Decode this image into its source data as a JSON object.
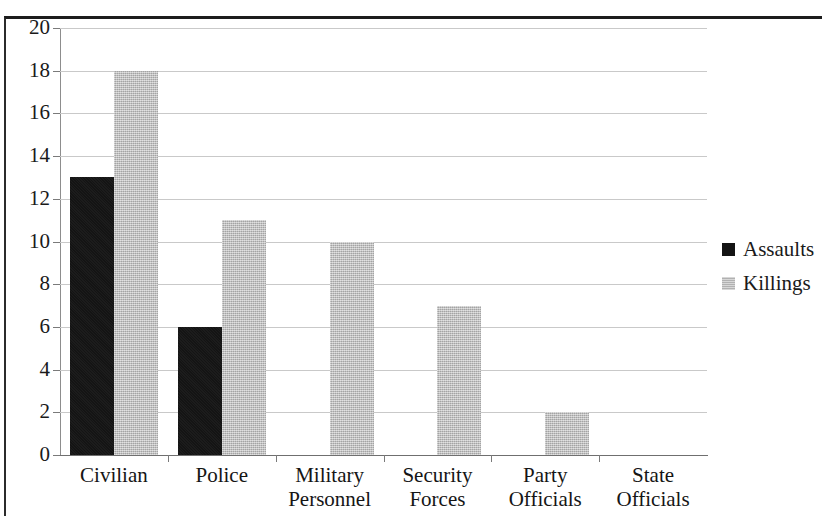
{
  "chart_data": {
    "type": "bar",
    "title": "",
    "subtitle": "",
    "xlabel": "",
    "ylabel": "",
    "categories": [
      "Civilian",
      "Police",
      "Military Personnel",
      "Security Forces",
      "Party Officials",
      "State Officials"
    ],
    "category_lines": [
      [
        "Civilian"
      ],
      [
        "Police"
      ],
      [
        "Military",
        "Personnel"
      ],
      [
        "Security",
        "Forces"
      ],
      [
        "Party",
        "Officials"
      ],
      [
        "State",
        "Officials"
      ]
    ],
    "series": [
      {
        "name": "Assaults",
        "color": "#141414",
        "values": [
          13,
          6,
          0,
          0,
          0,
          0
        ]
      },
      {
        "name": "Killings",
        "color": "#b9b9b9",
        "values": [
          18,
          11,
          10,
          7,
          2,
          0
        ]
      }
    ],
    "ylim": [
      0,
      20
    ],
    "ytick_step": 2,
    "ytick_labels": [
      "0",
      "2",
      "4",
      "6",
      "8",
      "10",
      "12",
      "14",
      "16",
      "18",
      "20"
    ],
    "grid": true,
    "grid_axis": "y",
    "legend_position": "right",
    "legend_entries": [
      "Assaults",
      "Killings"
    ]
  }
}
